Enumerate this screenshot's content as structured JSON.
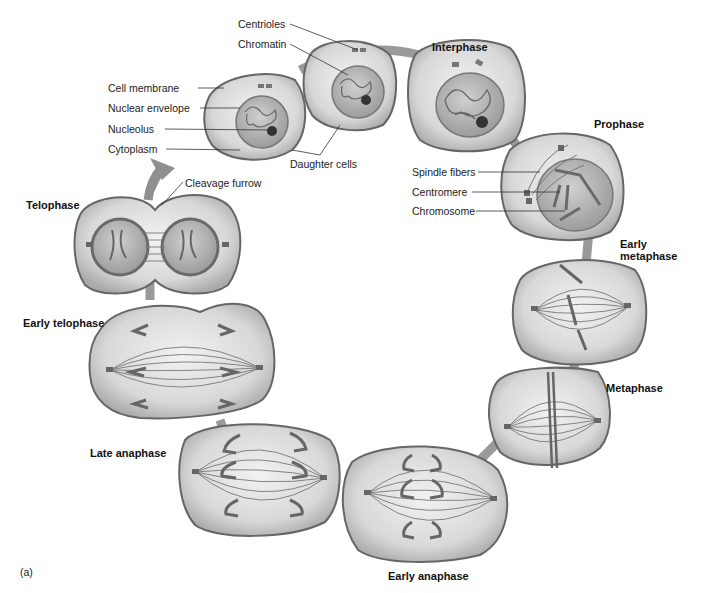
{
  "figure": {
    "panel_label": "(a)",
    "phases": [
      {
        "id": "interphase",
        "label": "Interphase"
      },
      {
        "id": "prophase",
        "label": "Prophase"
      },
      {
        "id": "early-metaphase",
        "label": "Early\nmetaphase",
        "line1": "Early",
        "line2": "metaphase"
      },
      {
        "id": "metaphase",
        "label": "Metaphase"
      },
      {
        "id": "early-anaphase",
        "label": "Early anaphase"
      },
      {
        "id": "late-anaphase",
        "label": "Late anaphase"
      },
      {
        "id": "early-telophase",
        "label": "Early telophase"
      },
      {
        "id": "telophase",
        "label": "Telophase"
      }
    ],
    "annotations": {
      "daughter_cells_left": [
        "Cell membrane",
        "Nuclear envelope",
        "Nucleolus",
        "Cytoplasm"
      ],
      "daughter_cells_top": [
        "Centrioles",
        "Chromatin"
      ],
      "daughter_cells": "Daughter cells",
      "prophase": [
        "Spindle fibers",
        "Centromere",
        "Chromosome"
      ],
      "telophase": "Cleavage furrow"
    },
    "colors": {
      "ring": "#9a9a9a",
      "cell_fill": "#d4d4d4",
      "cell_edge": "#6e6e6e",
      "nucleus_fill": "#bdbdbd",
      "chromosome": "#6a6a6a"
    }
  }
}
